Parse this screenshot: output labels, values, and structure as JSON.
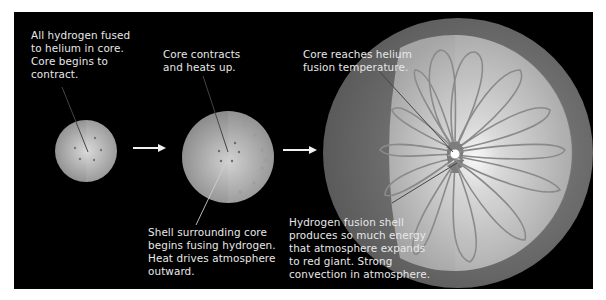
{
  "diagram": {
    "type": "stellar-evolution-sequence",
    "stages": [
      {
        "id": "stage-1",
        "caption": "All hydrogen fused\nto helium in core.\nCore begins to\ncontract."
      },
      {
        "id": "stage-2",
        "caption_top": "Core contracts\nand heats up.",
        "caption_bottom": "Shell surrounding core\nbegins fusing hydrogen.\nHeat drives atmosphere\noutward."
      },
      {
        "id": "stage-3",
        "caption_top": "Core reaches helium\nfusion temperature.",
        "caption_bottom": "Hydrogen fusion shell\nproduces so much energy\nthat atmosphere expands\nto red giant. Strong\nconvection in atmosphere."
      }
    ],
    "arrows": [
      "right-arrow",
      "right-arrow"
    ],
    "colors": {
      "background": "#000000",
      "text": "#e8e8e8",
      "star_light": "#d9d9d9",
      "star_dark": "#7a7a7a",
      "convection_arrows": "#8a8a8a"
    }
  }
}
